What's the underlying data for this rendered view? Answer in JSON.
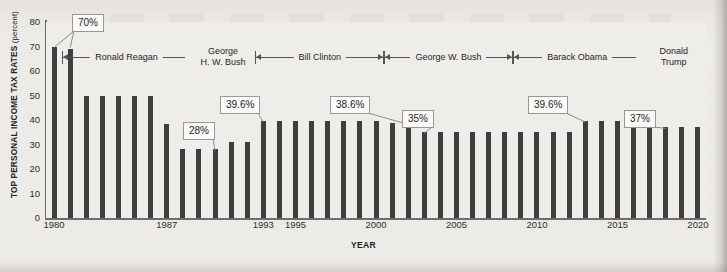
{
  "chart_data": {
    "type": "bar",
    "title": "",
    "xlabel": "YEAR",
    "ylabel": "TOP PERSONAL INCOME TAX RATES (percent)",
    "ylabel_main": "TOP PERSONAL INCOME TAX RATES",
    "ylabel_unit": "(percent)",
    "ylim": [
      0,
      80
    ],
    "yticks": [
      0,
      10,
      20,
      30,
      40,
      50,
      60,
      70,
      80
    ],
    "xticks": [
      "1980",
      "1987",
      "1993",
      "1995",
      "2000",
      "2005",
      "2010",
      "2015",
      "2020"
    ],
    "xtick_years": [
      1980,
      1987,
      1993,
      1995,
      2000,
      2005,
      2010,
      2015,
      2020
    ],
    "grid": false,
    "legend": "none",
    "bar_color": "#3e3e3e",
    "plot_background": "#efedea",
    "categories": [
      1980,
      1981,
      1982,
      1983,
      1984,
      1985,
      1986,
      1987,
      1988,
      1989,
      1990,
      1991,
      1992,
      1993,
      1994,
      1995,
      1996,
      1997,
      1998,
      1999,
      2000,
      2001,
      2002,
      2003,
      2004,
      2005,
      2006,
      2007,
      2008,
      2009,
      2010,
      2011,
      2012,
      2013,
      2014,
      2015,
      2016,
      2017,
      2018,
      2019,
      2020
    ],
    "values": [
      70,
      69.1,
      50,
      50,
      50,
      50,
      50,
      38.5,
      28,
      28,
      28,
      31,
      31,
      39.6,
      39.6,
      39.6,
      39.6,
      39.6,
      39.6,
      39.6,
      39.6,
      38.6,
      38.6,
      35,
      35,
      35,
      35,
      35,
      35,
      35,
      35,
      35,
      35,
      39.6,
      39.6,
      39.6,
      39.6,
      39.6,
      37,
      37,
      37
    ],
    "annotations": [
      {
        "text": "70%",
        "value": 70,
        "years": [
          1980,
          1981
        ]
      },
      {
        "text": "28%",
        "value": 28,
        "years": [
          1990
        ]
      },
      {
        "text": "39.6%",
        "value": 39.6,
        "years": [
          1993
        ]
      },
      {
        "text": "38.6%",
        "value": 38.6,
        "years": [
          2002
        ]
      },
      {
        "text": "35%",
        "value": 35,
        "years": [
          2003
        ]
      },
      {
        "text": "39.6%",
        "value": 39.6,
        "years": [
          2013
        ]
      },
      {
        "text": "37%",
        "value": 37,
        "years": [
          2018
        ]
      }
    ],
    "eras": [
      {
        "label": "Ronald Reagan",
        "start_year": 1981,
        "end_year": 1988,
        "lines": [
          "Ronald Reagan"
        ]
      },
      {
        "label": "George H. W. Bush",
        "start_year": 1989,
        "end_year": 1992,
        "lines": [
          "George",
          "H. W. Bush"
        ]
      },
      {
        "label": "Bill Clinton",
        "start_year": 1993,
        "end_year": 2000,
        "lines": [
          "Bill Clinton"
        ]
      },
      {
        "label": "George W. Bush",
        "start_year": 2001,
        "end_year": 2008,
        "lines": [
          "George W. Bush"
        ]
      },
      {
        "label": "Barack Obama",
        "start_year": 2009,
        "end_year": 2016,
        "lines": [
          "Barack Obama"
        ]
      },
      {
        "label": "Donald Trump",
        "start_year": 2017,
        "end_year": 2020,
        "lines": [
          "Donald",
          "Trump"
        ]
      }
    ]
  }
}
